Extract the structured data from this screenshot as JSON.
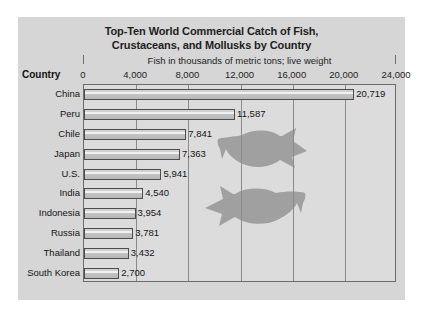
{
  "chart_data": {
    "type": "bar",
    "orientation": "horizontal",
    "title": "Top-Ten World Commercial Catch of Fish, Crustaceans, and Mollusks by Country",
    "title_line1": "Top-Ten World Commercial Catch of Fish,",
    "title_line2": "Crustaceans, and Mollusks by Country",
    "subtitle": "Fish in thousands of metric tons; live weight",
    "category_axis_label": "Country",
    "xlabel": "Fish in thousands of metric tons; live weight",
    "ylabel": "Country",
    "categories": [
      "China",
      "Peru",
      "Chile",
      "Japan",
      "U.S.",
      "India",
      "Indonesia",
      "Russia",
      "Thailand",
      "South Korea"
    ],
    "values": [
      20719,
      11587,
      7841,
      7363,
      5941,
      4540,
      3954,
      3781,
      3432,
      2700
    ],
    "value_labels": [
      "20,719",
      "11,587",
      "7,841",
      "7,363",
      "5,941",
      "4,540",
      "3,954",
      "3,781",
      "3,432",
      "2,700"
    ],
    "xlim": [
      0,
      24000
    ],
    "xticks": [
      0,
      4000,
      8000,
      12000,
      16000,
      20000,
      24000
    ],
    "xtick_labels": [
      "0",
      "4,000",
      "8,000",
      "12,000",
      "16,000",
      "20,000",
      "24,000"
    ],
    "grid": true,
    "grid_axis": "x",
    "legend": false,
    "colors": {
      "panel_background": "#d6d6d6",
      "plot_background": "#dcdcdc",
      "bar_fill": "#d2d2d2",
      "bar_border": "#4d4d4d",
      "gridline": "#8a8a8a",
      "text": "#141414",
      "decoration_fish": "#a0a0a0"
    },
    "annotations": [
      {
        "name": "fish-silhouette-upper",
        "description": "gray fish silhouette facing right"
      },
      {
        "name": "fish-silhouette-lower",
        "description": "gray fish silhouette facing left"
      }
    ]
  }
}
